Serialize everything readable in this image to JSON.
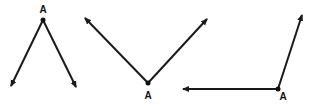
{
  "diagram": {
    "colors": {
      "stroke": "#1a1a1a",
      "background": "#ffffff"
    },
    "angles": [
      {
        "name": "angle-1",
        "vertex": {
          "x": 43,
          "y": 20,
          "label": "A",
          "label_x": 43,
          "label_y": 13
        },
        "rays": [
          {
            "x": 11,
            "y": 86
          },
          {
            "x": 76,
            "y": 87
          }
        ]
      },
      {
        "name": "angle-2",
        "vertex": {
          "x": 148,
          "y": 83,
          "label": "A",
          "label_x": 148,
          "label_y": 98
        },
        "rays": [
          {
            "x": 85,
            "y": 18
          },
          {
            "x": 207,
            "y": 19
          }
        ]
      },
      {
        "name": "angle-3",
        "vertex": {
          "x": 278,
          "y": 89,
          "label": "A",
          "label_x": 283,
          "label_y": 99
        },
        "rays": [
          {
            "x": 183,
            "y": 89
          },
          {
            "x": 302,
            "y": 15
          }
        ]
      }
    ]
  }
}
